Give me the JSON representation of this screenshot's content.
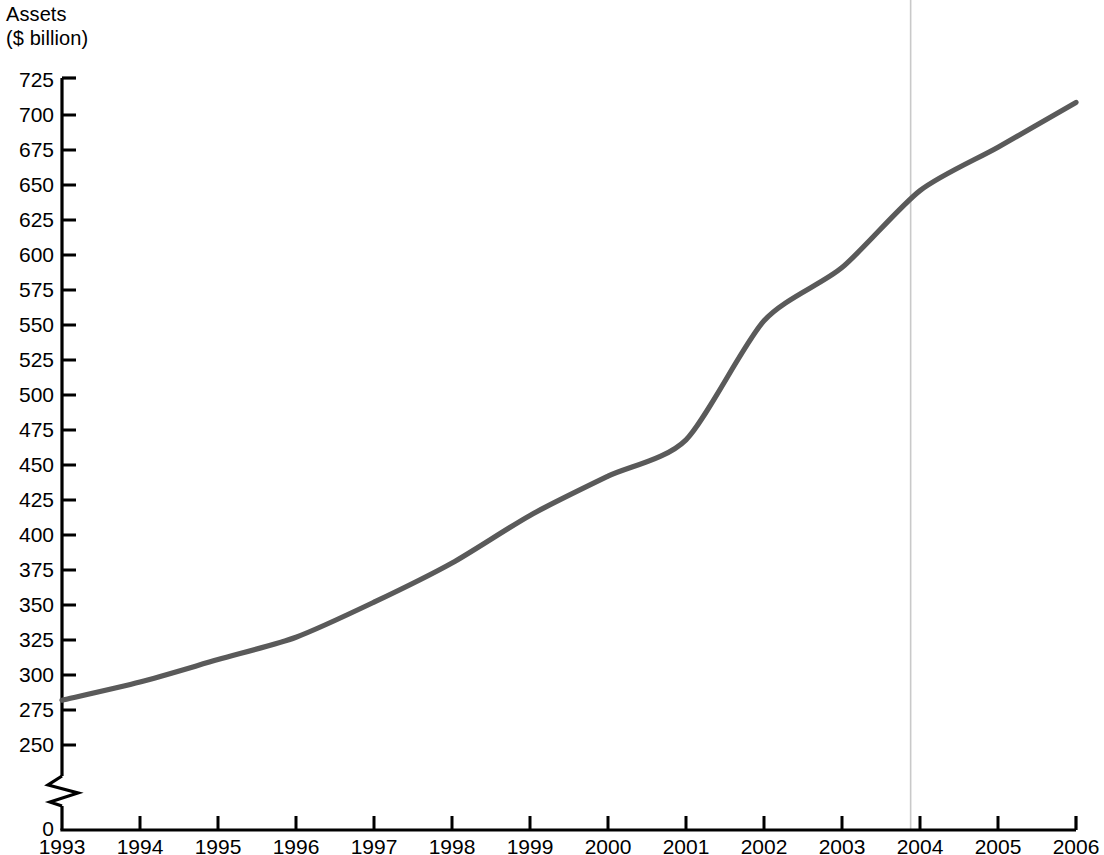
{
  "chart_data": {
    "type": "line",
    "title": "",
    "ylabel": "Assets\n($ billion)",
    "ylabel_line1": "Assets",
    "ylabel_line2": "($ billion)",
    "xlabel": "",
    "x": [
      1993,
      1994,
      1995,
      1996,
      1997,
      1998,
      1999,
      2000,
      2001,
      2002,
      2003,
      2004,
      2005,
      2006
    ],
    "categories": [
      "1993",
      "1994",
      "1995",
      "1996",
      "1997",
      "1998",
      "1999",
      "2000",
      "2001",
      "2002",
      "2003",
      "2004",
      "2005",
      "2006"
    ],
    "values": [
      282,
      295,
      311,
      327,
      352,
      380,
      414,
      442,
      468,
      553,
      591,
      646,
      677,
      709
    ],
    "series": [
      {
        "name": "Assets",
        "color": "#5a5a5a",
        "values": [
          282,
          295,
          311,
          327,
          352,
          380,
          414,
          442,
          468,
          553,
          591,
          646,
          677,
          709
        ]
      }
    ],
    "ylim": [
      250,
      725
    ],
    "yticks": [
      250,
      275,
      300,
      325,
      350,
      375,
      400,
      425,
      450,
      475,
      500,
      525,
      550,
      575,
      600,
      625,
      650,
      675,
      700,
      725
    ],
    "ytick_labels": [
      "250",
      "275",
      "300",
      "325",
      "350",
      "375",
      "400",
      "425",
      "450",
      "475",
      "500",
      "525",
      "550",
      "575",
      "600",
      "625",
      "650",
      "675",
      "700",
      "725"
    ],
    "y_origin_label": "0",
    "axis_break": true,
    "grid": false,
    "legend": "none",
    "annotations": [
      {
        "type": "vertical-rule",
        "x": 2003.88,
        "color": "#c9c9c9",
        "label": ""
      }
    ],
    "colors": {
      "line": "#5a5a5a",
      "axis": "#000000",
      "vertical_rule": "#c9c9c9",
      "background": "#ffffff"
    }
  }
}
